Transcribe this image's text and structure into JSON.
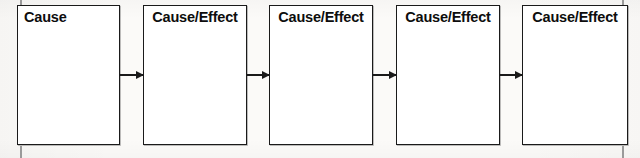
{
  "diagram": {
    "type": "sequence-flowchart",
    "background_color": "#fbfaf8",
    "line_color": "#1a1a1a",
    "box_fill_color": "#ffffff",
    "nodes": [
      {
        "id": "node-1",
        "label": "Cause",
        "align": "left",
        "x": 17,
        "y": 5,
        "width": 103,
        "height": 140
      },
      {
        "id": "node-2",
        "label": "Cause/Effect",
        "align": "center",
        "x": 143,
        "y": 5,
        "width": 104,
        "height": 140
      },
      {
        "id": "node-3",
        "label": "Cause/Effect",
        "align": "center",
        "x": 269,
        "y": 5,
        "width": 104,
        "height": 140
      },
      {
        "id": "node-4",
        "label": "Cause/Effect",
        "align": "center",
        "x": 396,
        "y": 5,
        "width": 104,
        "height": 140
      },
      {
        "id": "node-5",
        "label": "Cause/Effect",
        "align": "center",
        "x": 522,
        "y": 5,
        "width": 106,
        "height": 140
      }
    ],
    "connectors": [
      {
        "id": "arrow-1-2",
        "from": "node-1",
        "to": "node-2",
        "x": 120,
        "width": 23
      },
      {
        "id": "arrow-2-3",
        "from": "node-2",
        "to": "node-3",
        "x": 247,
        "width": 22
      },
      {
        "id": "arrow-3-4",
        "from": "node-3",
        "to": "node-4",
        "x": 373,
        "width": 23
      },
      {
        "id": "arrow-4-5",
        "from": "node-4",
        "to": "node-5",
        "x": 500,
        "width": 22
      }
    ],
    "crop_marks": [
      {
        "id": "crop-mark-top-left",
        "x": 20,
        "y": 0,
        "height": 7
      },
      {
        "id": "crop-mark-top-right",
        "x": 622,
        "y": 0,
        "height": 6
      },
      {
        "id": "crop-mark-bottom-left",
        "x": 20,
        "y": 146,
        "height": 12
      },
      {
        "id": "crop-mark-bottom-right",
        "x": 622,
        "y": 146,
        "height": 12
      }
    ]
  }
}
